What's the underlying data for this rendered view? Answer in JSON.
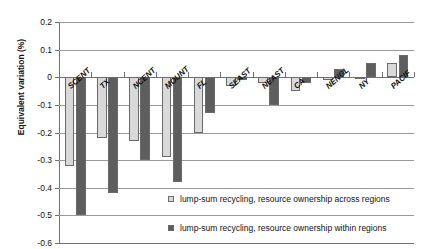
{
  "chart_data": {
    "type": "bar",
    "title": "",
    "xlabel": "",
    "ylabel": "Equivalent variation (%)",
    "ylim": [
      -0.6,
      0.2
    ],
    "yticks": [
      0.2,
      0.1,
      0,
      -0.1,
      -0.2,
      -0.3,
      -0.4,
      -0.5,
      -0.6
    ],
    "ytick_labels": [
      "0.2",
      "0.1",
      "0",
      "-0.1",
      "-0.2",
      "-0.3",
      "-0.4",
      "-0.5",
      "-0.6"
    ],
    "grid": true,
    "legend_position": "inside-lower-right",
    "categories": [
      "SCENT",
      "TX",
      "NCENT",
      "MOUNT",
      "FL",
      "SEAST",
      "NEAST",
      "CA",
      "NENGL",
      "NY",
      "PACIF"
    ],
    "series": [
      {
        "name": "lump-sum recycling, resource ownership across regions",
        "color": "#d9d9d9",
        "values": [
          -0.32,
          -0.22,
          -0.23,
          -0.29,
          -0.2,
          -0.03,
          -0.02,
          -0.05,
          -0.01,
          0.0,
          0.05
        ]
      },
      {
        "name": "lump-sum recycling, resource ownership within regions",
        "color": "#5e5e5e",
        "values": [
          -0.5,
          -0.42,
          -0.3,
          -0.38,
          -0.13,
          -0.01,
          -0.1,
          -0.02,
          0.03,
          0.05,
          0.08
        ]
      }
    ]
  },
  "axis": {
    "y_title": "Equivalent variation (%)"
  },
  "legend": {
    "entries": [
      {
        "swatch": "light-gray-swatch",
        "label": "lump-sum recycling, resource ownership across regions"
      },
      {
        "swatch": "dark-gray-swatch",
        "label": "lump-sum recycling, resource ownership within regions"
      }
    ]
  },
  "colors": {
    "series_across": "#d9d9d9",
    "series_within": "#5e5e5e",
    "gridline": "#9a9a9a",
    "axis": "#6f6f6f"
  }
}
